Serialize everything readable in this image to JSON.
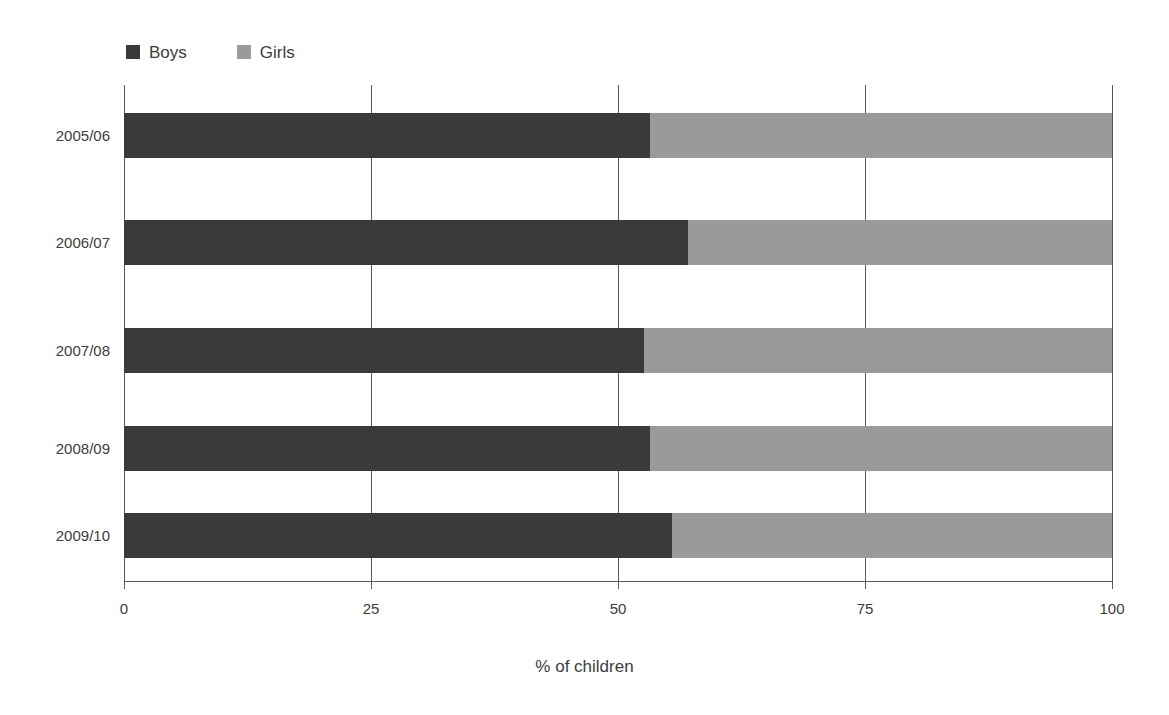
{
  "chart_data": {
    "type": "bar",
    "orientation": "horizontal",
    "stacked": true,
    "stacked_percent": true,
    "title": "",
    "xlabel": "% of children",
    "ylabel": "",
    "xlim": [
      0,
      100
    ],
    "xticks": [
      0,
      25,
      50,
      75,
      100
    ],
    "xtick_labels": [
      "0",
      "25",
      "50",
      "75",
      "100"
    ],
    "grid": true,
    "grid_axis": "x",
    "legend_position": "top-left",
    "categories": [
      "2005/06",
      "2006/07",
      "2007/08",
      "2008/09",
      "2009/10"
    ],
    "series": [
      {
        "name": "Boys",
        "color": "#3a3a3a",
        "values": [
          53.2,
          57.1,
          52.6,
          53.2,
          55.5
        ]
      },
      {
        "name": "Girls",
        "color": "#9a9a9a",
        "values": [
          46.8,
          42.9,
          47.4,
          46.8,
          44.5
        ]
      }
    ]
  },
  "legend": {
    "items": [
      {
        "label": "Boys",
        "color": "#3a3a3a"
      },
      {
        "label": "Girls",
        "color": "#9a9a9a"
      }
    ]
  },
  "axes": {
    "x_title": "% of children",
    "x_tick_labels": [
      "0",
      "25",
      "50",
      "75",
      "100"
    ],
    "y_tick_labels": [
      "2005/06",
      "2006/07",
      "2007/08",
      "2008/09",
      "2009/10"
    ]
  },
  "colors": {
    "boys": "#3a3a3a",
    "girls": "#9a9a9a",
    "axis": "#58595b",
    "text": "#3c3c3c",
    "background": "#ffffff"
  }
}
